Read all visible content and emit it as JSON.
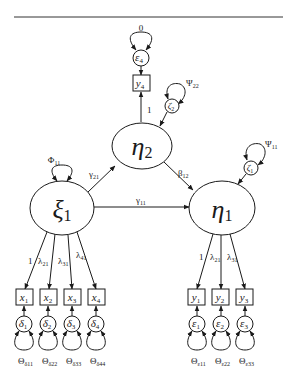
{
  "diagram": {
    "type": "structural-equation-model",
    "colors": {
      "ink": "#1a1a1a",
      "background": "#ffffff"
    },
    "latent": {
      "xi1": {
        "symbol": "ξ",
        "sub": "1",
        "variance_label": "Φ",
        "variance_sub": "11"
      },
      "eta1": {
        "symbol": "η",
        "sub": "1",
        "disturbance": "ζ",
        "disturbance_sub": "1",
        "disturbance_variance": "Ψ",
        "disturbance_variance_sub": "11"
      },
      "eta2": {
        "symbol": "η",
        "sub": "2",
        "disturbance": "ζ",
        "disturbance_sub": "2",
        "disturbance_variance": "Ψ",
        "disturbance_variance_sub": "22"
      }
    },
    "structural_paths": [
      {
        "from": "xi1",
        "to": "eta2",
        "label": "γ",
        "sub": "21"
      },
      {
        "from": "xi1",
        "to": "eta1",
        "label": "γ",
        "sub": "11"
      },
      {
        "from": "eta2",
        "to": "eta1",
        "label": "β",
        "sub": "12"
      }
    ],
    "x_indicators": [
      {
        "name": "x",
        "sub": "1",
        "loading": "1",
        "loading_sub": "",
        "error": "δ",
        "error_sub": "1",
        "error_var": "Θ",
        "error_var_sub": "δ11"
      },
      {
        "name": "x",
        "sub": "2",
        "loading": "λ",
        "loading_sub": "21",
        "error": "δ",
        "error_sub": "2",
        "error_var": "Θ",
        "error_var_sub": "δ22"
      },
      {
        "name": "x",
        "sub": "3",
        "loading": "λ",
        "loading_sub": "31",
        "error": "δ",
        "error_sub": "3",
        "error_var": "Θ",
        "error_var_sub": "δ33"
      },
      {
        "name": "x",
        "sub": "4",
        "loading": "λ",
        "loading_sub": "41",
        "error": "δ",
        "error_sub": "4",
        "error_var": "Θ",
        "error_var_sub": "δ44"
      }
    ],
    "y_indicators_eta1": [
      {
        "name": "y",
        "sub": "1",
        "loading": "1",
        "loading_sub": "",
        "error": "ε",
        "error_sub": "1",
        "error_var": "Θ",
        "error_var_sub": "ε11"
      },
      {
        "name": "y",
        "sub": "2",
        "loading": "λ",
        "loading_sub": "21",
        "error": "ε",
        "error_sub": "2",
        "error_var": "Θ",
        "error_var_sub": "ε22"
      },
      {
        "name": "y",
        "sub": "3",
        "loading": "λ",
        "loading_sub": "31",
        "error": "ε",
        "error_sub": "3",
        "error_var": "Θ",
        "error_var_sub": "ε33"
      }
    ],
    "y_indicator_eta2": {
      "name": "y",
      "sub": "4",
      "loading": "1",
      "error": "ε",
      "error_sub": "4",
      "error_var": "0"
    }
  }
}
